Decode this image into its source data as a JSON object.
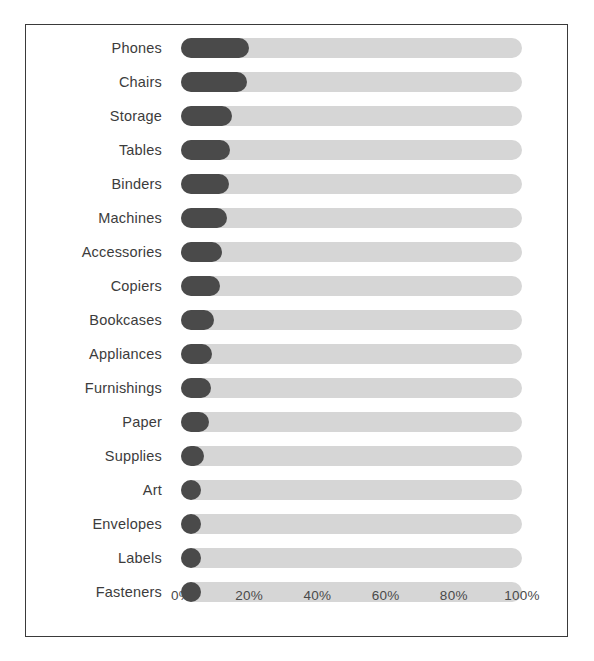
{
  "title_remnant": "Sales by Sub-Category",
  "chart_data": {
    "type": "bar",
    "orientation": "horizontal",
    "title": "",
    "xlabel": "",
    "ylabel": "",
    "xlim": [
      0,
      100
    ],
    "grid": false,
    "legend": "none",
    "value_suffix": "%",
    "bar_style": "rounded-pill-with-track",
    "track_color": "#d6d6d6",
    "bar_color": "#4a4a4a",
    "frame_color": "#3a3a3a",
    "label_color": "#3c3c3c",
    "xticks": [
      "0%",
      "20%",
      "40%",
      "60%",
      "80%",
      "100%"
    ],
    "xtick_values": [
      0,
      20,
      40,
      60,
      80,
      100
    ],
    "categories": [
      "Phones",
      "Chairs",
      "Storage",
      "Tables",
      "Binders",
      "Machines",
      "Accessories",
      "Copiers",
      "Bookcases",
      "Appliances",
      "Furnishings",
      "Paper",
      "Supplies",
      "Art",
      "Envelopes",
      "Labels",
      "Fasteners"
    ],
    "values": [
      19.8,
      19.4,
      15.0,
      14.4,
      14.0,
      13.6,
      12.1,
      11.5,
      9.7,
      9.1,
      8.8,
      8.2,
      6.6,
      5.6,
      5.0,
      4.7,
      4.4
    ]
  }
}
